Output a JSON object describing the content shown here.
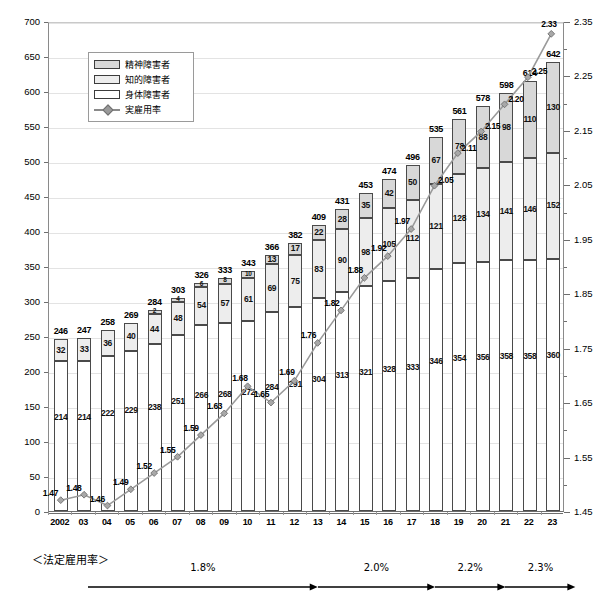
{
  "chart_data": {
    "type": "bar",
    "subtype": "stacked-bar-with-line",
    "title": "",
    "xlabel": "",
    "ylabel": "",
    "y2label": "",
    "grid": true,
    "legend_position": "top-left-inside",
    "ylim": [
      0,
      700
    ],
    "ytick_step": 50,
    "y2lim": [
      1.45,
      2.35
    ],
    "y2tick_step": 0.05,
    "yticks": [
      "0",
      "50",
      "100",
      "150",
      "200",
      "250",
      "300",
      "350",
      "400",
      "450",
      "500",
      "550",
      "600",
      "650",
      "700"
    ],
    "y2ticks": [
      "1.45",
      "1.50",
      "1.55",
      "1.60",
      "1.65",
      "1.70",
      "1.75",
      "1.80",
      "1.85",
      "1.90",
      "1.95",
      "2.00",
      "2.05",
      "2.10",
      "2.15",
      "2.20",
      "2.25",
      "2.30",
      "2.35"
    ],
    "y2ticks_labeled": [
      "1.45",
      "1.55",
      "1.65",
      "1.75",
      "1.85",
      "1.95",
      "2.05",
      "2.15",
      "2.25",
      "2.35"
    ],
    "categories": [
      "2002",
      "03",
      "04",
      "05",
      "06",
      "07",
      "08",
      "09",
      "10",
      "11",
      "12",
      "13",
      "14",
      "15",
      "16",
      "17",
      "18",
      "19",
      "20",
      "21",
      "22",
      "23"
    ],
    "series": [
      {
        "name": "身体障害者",
        "key": "physical",
        "color": "#ffffff",
        "values": [
          214,
          214,
          222,
          229,
          238,
          251,
          266,
          268,
          272,
          284,
          291,
          304,
          313,
          321,
          328,
          333,
          346,
          354,
          356,
          358,
          358,
          360
        ]
      },
      {
        "name": "知的障害者",
        "key": "intellectual",
        "color": "#ededed",
        "values": [
          32,
          33,
          36,
          40,
          44,
          48,
          54,
          57,
          61,
          69,
          75,
          83,
          90,
          98,
          105,
          112,
          121,
          128,
          134,
          141,
          146,
          152
        ]
      },
      {
        "name": "精神障害者",
        "key": "mental",
        "color": "#d8d8d8",
        "values": [
          0,
          0,
          0,
          0,
          2,
          4,
          6,
          8,
          10,
          13,
          17,
          22,
          28,
          35,
          42,
          50,
          67,
          78,
          88,
          98,
          110,
          130
        ]
      }
    ],
    "totals": [
      246,
      247,
      258,
      269,
      284,
      303,
      326,
      333,
      343,
      366,
      382,
      409,
      431,
      453,
      474,
      496,
      535,
      561,
      578,
      598,
      614,
      642
    ],
    "line_series": {
      "name": "実雇用率",
      "color": "#9a9a9a",
      "marker": "diamond",
      "values": [
        1.47,
        1.48,
        1.46,
        1.49,
        1.52,
        1.55,
        1.59,
        1.63,
        1.68,
        1.65,
        1.69,
        1.76,
        1.82,
        1.88,
        1.92,
        1.97,
        2.05,
        2.11,
        2.15,
        2.2,
        2.25,
        2.33
      ],
      "labels": [
        "1.47",
        "1.48",
        "1.46",
        "1.49",
        "1.52",
        "1.55",
        "1.59",
        "1.63",
        "1.68",
        "1.65",
        "1.69",
        "1.76",
        "1.82",
        "1.88",
        "1.92",
        "1.97",
        "2.05",
        "2.11",
        "2.15",
        "2.20",
        "2.25",
        "2.33"
      ]
    }
  },
  "legend": {
    "items": [
      {
        "label": "精神障害者",
        "type": "swatch",
        "swatch_class": "sw-mental"
      },
      {
        "label": "知的障害者",
        "type": "swatch",
        "swatch_class": "sw-intel"
      },
      {
        "label": "身体障害者",
        "type": "swatch",
        "swatch_class": "sw-phys"
      },
      {
        "label": "実雇用率",
        "type": "line"
      }
    ]
  },
  "footer": {
    "title": "＜法定雇用率＞",
    "bands": [
      {
        "label": "1.8%",
        "start_index": 0,
        "end_index": 11
      },
      {
        "label": "2.0%",
        "start_index": 11,
        "end_index": 16
      },
      {
        "label": "2.2%",
        "start_index": 16,
        "end_index": 19
      },
      {
        "label": "2.3%",
        "start_index": 19,
        "end_index": 22
      }
    ]
  }
}
